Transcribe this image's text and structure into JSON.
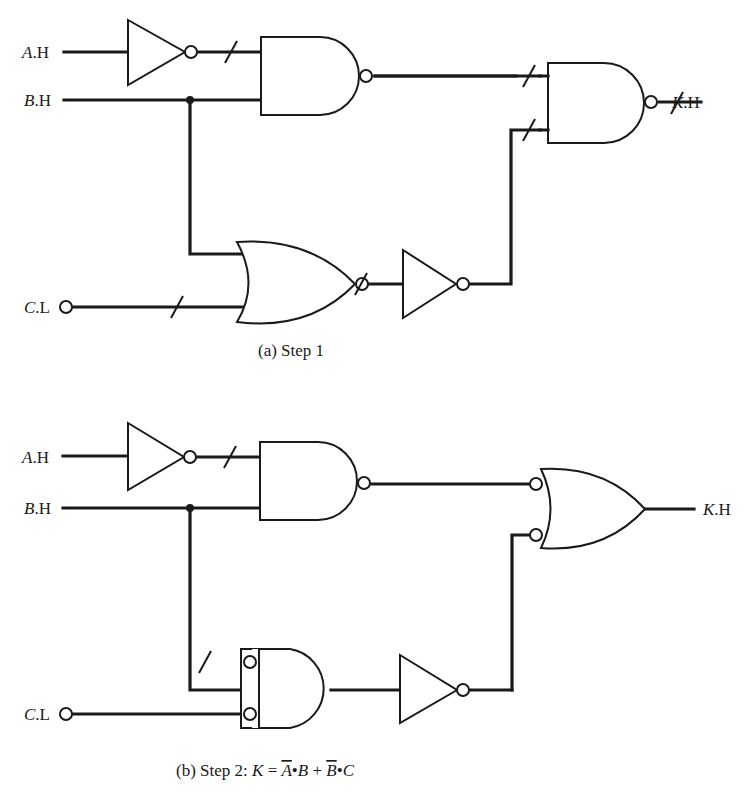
{
  "figure": {
    "panel_a": {
      "caption": "(a)  Step 1",
      "inputs": [
        {
          "var": "A",
          "suffix": ".H"
        },
        {
          "var": "B",
          "suffix": ".H"
        },
        {
          "var": "C",
          "suffix": ".L"
        }
      ],
      "output": {
        "var": "K",
        "suffix": ".H"
      },
      "gates": [
        "inverter",
        "nand",
        "nor",
        "inverter",
        "nand"
      ]
    },
    "panel_b": {
      "caption_prefix": "(b)  Step 2:  ",
      "equation": {
        "lhs": "K",
        "eq": " = ",
        "t1_var1": "A",
        "t1_var2": "B",
        "plus": " + ",
        "t2_var1": "B",
        "t2_var2": "C",
        "dot": "•"
      },
      "inputs": [
        {
          "var": "A",
          "suffix": ".H"
        },
        {
          "var": "B",
          "suffix": ".H"
        },
        {
          "var": "C",
          "suffix": ".L"
        }
      ],
      "output": {
        "var": "K",
        "suffix": ".H"
      },
      "gates": [
        "inverter",
        "nand",
        "and-inverted-inputs",
        "inverter",
        "or-inverted-inputs"
      ]
    }
  }
}
